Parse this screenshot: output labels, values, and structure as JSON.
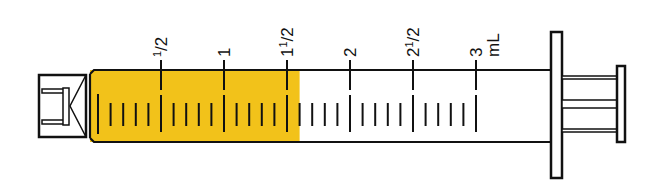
{
  "diagram": {
    "unit": "mL",
    "fill_volume_ml": 1.6,
    "fill_color": "#f2c21a",
    "outline_color": "#111111",
    "scale_labels": [
      {
        "text": "1/2",
        "value": 0.5
      },
      {
        "text": "1",
        "value": 1
      },
      {
        "text": "1 1/2",
        "value": 1.5
      },
      {
        "text": "2",
        "value": 2
      },
      {
        "text": "2 1/2",
        "value": 2.5
      },
      {
        "text": "3",
        "value": 3
      }
    ],
    "label_parts": {
      "half": {
        "whole": "",
        "num": "1",
        "den": "2"
      },
      "one": "1",
      "one_half": {
        "whole": "1",
        "num": "1",
        "den": "2"
      },
      "two": "2",
      "two_half": {
        "whole": "2",
        "num": "1",
        "den": "2"
      },
      "three": "3",
      "unit": "mL"
    },
    "minor_tick_step_ml": 0.1,
    "max_ml": 3
  }
}
